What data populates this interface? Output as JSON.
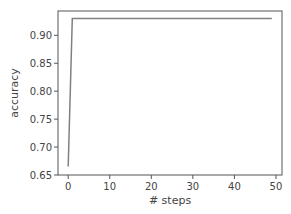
{
  "chart_data": {
    "type": "line",
    "title": "",
    "xlabel": "# steps",
    "ylabel": "accuracy",
    "xlim": [
      -2.45,
      51.45
    ],
    "ylim": [
      0.65,
      0.9435
    ],
    "xticks": [
      0,
      10,
      20,
      30,
      40,
      50
    ],
    "yticks": [
      0.65,
      0.7,
      0.75,
      0.8,
      0.85,
      0.9
    ],
    "ytick_labels": [
      "0.65",
      "0.70",
      "0.75",
      "0.80",
      "0.85",
      "0.90"
    ],
    "grid": false,
    "legend": null,
    "series": [
      {
        "name": "accuracy",
        "color": "#808080",
        "x": [
          0,
          1,
          2,
          3,
          4,
          5,
          6,
          7,
          8,
          9,
          10,
          11,
          12,
          13,
          14,
          15,
          16,
          17,
          18,
          19,
          20,
          21,
          22,
          23,
          24,
          25,
          26,
          27,
          28,
          29,
          30,
          31,
          32,
          33,
          34,
          35,
          36,
          37,
          38,
          39,
          40,
          41,
          42,
          43,
          44,
          45,
          46,
          47,
          48,
          49
        ],
        "values": [
          0.665,
          0.93,
          0.93,
          0.93,
          0.93,
          0.93,
          0.93,
          0.93,
          0.93,
          0.93,
          0.93,
          0.93,
          0.93,
          0.93,
          0.93,
          0.93,
          0.93,
          0.93,
          0.93,
          0.93,
          0.93,
          0.93,
          0.93,
          0.93,
          0.93,
          0.93,
          0.93,
          0.93,
          0.93,
          0.93,
          0.93,
          0.93,
          0.93,
          0.93,
          0.93,
          0.93,
          0.93,
          0.93,
          0.93,
          0.93,
          0.93,
          0.93,
          0.93,
          0.93,
          0.93,
          0.93,
          0.93,
          0.93,
          0.93,
          0.93
        ]
      }
    ]
  }
}
